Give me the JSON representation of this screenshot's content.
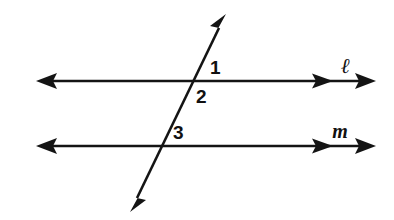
{
  "figure": {
    "background_color": "#ffffff",
    "stroke_color": "#141414",
    "width": 394,
    "height": 220
  },
  "lines": [
    {
      "id": "line-l",
      "label": "ℓ",
      "label_x": 345,
      "label_y": 73,
      "y": 81,
      "x_start": 36,
      "x_end": 374,
      "inner_arrow_x": 330,
      "arrow_left": true,
      "arrow_right": true
    },
    {
      "id": "line-m",
      "label": "m",
      "label_x": 340,
      "label_y": 138,
      "y": 146,
      "x_start": 36,
      "x_end": 374,
      "inner_arrow_x": 330,
      "arrow_left": true,
      "arrow_right": true
    }
  ],
  "transversal": {
    "id": "transversal",
    "label": "",
    "x1": 225,
    "y1": 16,
    "x2": 131,
    "y2": 210,
    "arrow_start": true,
    "arrow_end": true
  },
  "intersections": [
    {
      "id": "intersection-l",
      "x": 195,
      "y": 81
    },
    {
      "id": "intersection-m",
      "x": 163,
      "y": 146
    }
  ],
  "angle_labels": [
    {
      "id": "angle-1",
      "text": "1",
      "x": 210,
      "y": 74
    },
    {
      "id": "angle-2",
      "text": "2",
      "x": 196,
      "y": 103
    },
    {
      "id": "angle-3",
      "text": "3",
      "x": 173,
      "y": 139
    }
  ]
}
